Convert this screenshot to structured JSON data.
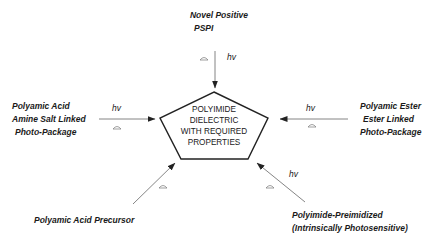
{
  "center": {
    "lines": [
      "POLYIMIDE",
      "DIELECTRIC",
      "WITH REQUIRED",
      "PROPERTIES"
    ]
  },
  "sources": {
    "top": {
      "lines": [
        "Novel Positive",
        "PSPI"
      ],
      "hv": "hv",
      "heat": "delta"
    },
    "left": {
      "lines": [
        "Polyamic Acid",
        "Amine Salt Linked",
        "Photo-Package"
      ],
      "hv": "hv",
      "heat": "delta"
    },
    "right": {
      "lines": [
        "Polyamic Ester",
        "Ester Linked",
        "Photo-Package"
      ],
      "hv": "hv",
      "heat": "delta"
    },
    "bottom_left": {
      "lines": [
        "Polyamic Acid Precursor"
      ],
      "heat": "delta"
    },
    "bottom_right": {
      "lines": [
        "Polyimide-Preimidized",
        "(Intrinsically Photosensitive)"
      ],
      "hv": "hv",
      "heat": "delta"
    }
  },
  "colors": {
    "line": "#333333",
    "arrow": "#555555",
    "text": "#1a1a1a"
  }
}
